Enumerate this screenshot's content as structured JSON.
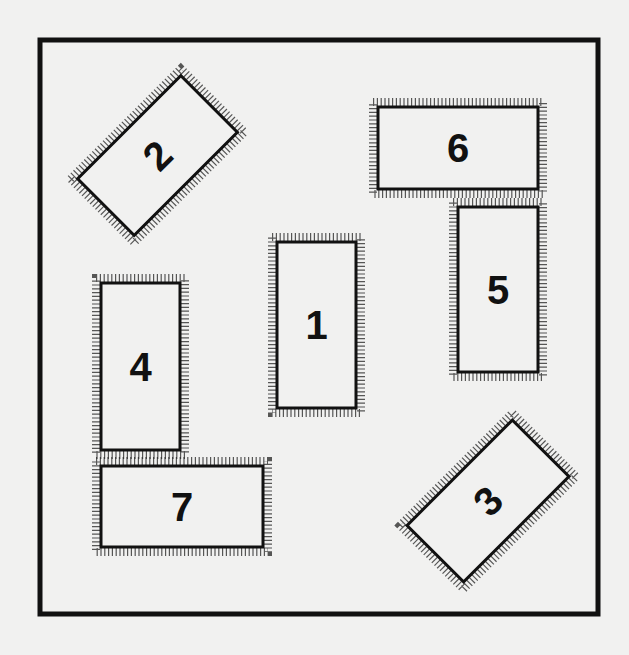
{
  "figure": {
    "frame": {
      "x": 40,
      "y": 40,
      "width": 558,
      "height": 574
    },
    "background": "#f1f1f0",
    "ink": "#111111",
    "rectangles": [
      {
        "label": "1",
        "cx": 316.5,
        "cy": 325,
        "w": 79,
        "h": 166,
        "angle": 0
      },
      {
        "label": "2",
        "cx": 157.5,
        "cy": 155.5,
        "w": 146,
        "h": 80,
        "angle": -45
      },
      {
        "label": "3",
        "cx": 488,
        "cy": 501,
        "w": 149,
        "h": 80,
        "angle": -45
      },
      {
        "label": "4",
        "cx": 140.5,
        "cy": 366.5,
        "w": 79,
        "h": 167,
        "angle": 0
      },
      {
        "label": "5",
        "cx": 498,
        "cy": 289.5,
        "w": 80,
        "h": 165,
        "angle": 0
      },
      {
        "label": "6",
        "cx": 458,
        "cy": 148,
        "w": 160,
        "h": 82,
        "angle": 0
      },
      {
        "label": "7",
        "cx": 182,
        "cy": 506.5,
        "w": 162,
        "h": 81,
        "angle": 0
      }
    ]
  }
}
